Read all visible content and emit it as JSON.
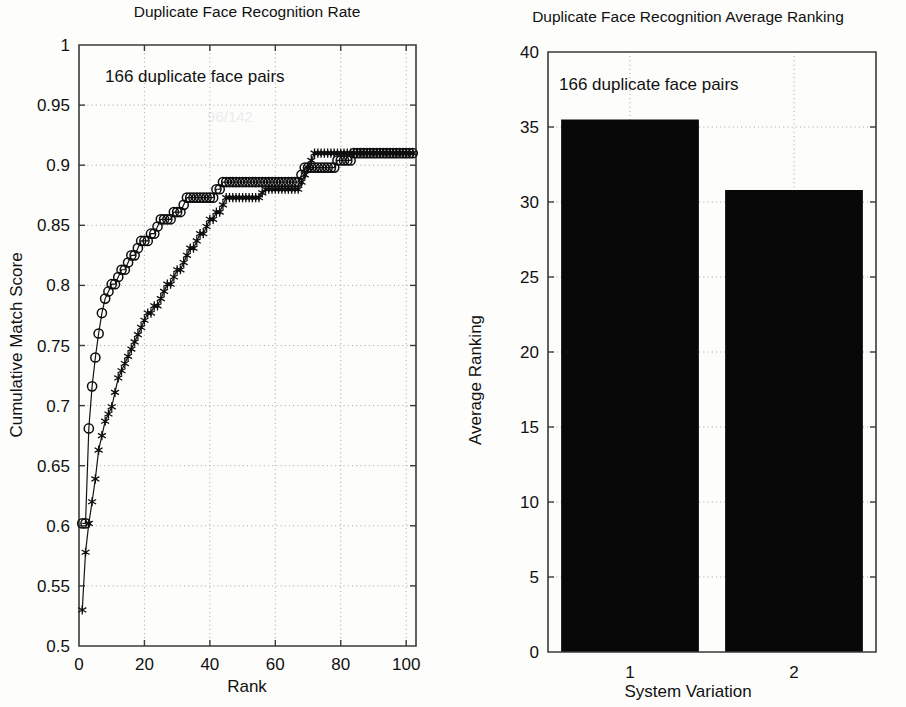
{
  "figure": {
    "background_color": "#fdfdfb",
    "ink_color": "#111111"
  },
  "charts": [
    {
      "id": "cms-curve",
      "title": "Duplicate Face Recognition Rate",
      "annotation": "166 duplicate face pairs",
      "xlabel": "Rank",
      "ylabel": "Cumulative Match Score"
    },
    {
      "id": "avg-ranking-bars",
      "title": "Duplicate Face Recognition Average Ranking",
      "annotation": "166 duplicate face pairs",
      "xlabel": "System Variation",
      "ylabel": "Average Ranking"
    }
  ],
  "chart_data": [
    {
      "type": "line",
      "title": "Duplicate Face Recognition Rate",
      "subtitle": "166 duplicate face pairs",
      "xlabel": "Rank",
      "ylabel": "Cumulative Match Score",
      "xlim": [
        0,
        103
      ],
      "ylim": [
        0.5,
        1.0
      ],
      "xticks": [
        0,
        20,
        40,
        60,
        80,
        100
      ],
      "yticks": [
        0.5,
        0.55,
        0.6,
        0.65,
        0.7,
        0.75,
        0.8,
        0.85,
        0.9,
        0.95,
        1
      ],
      "xticklabels": [
        "0",
        "20",
        "40",
        "60",
        "80",
        "100"
      ],
      "yticklabels": [
        "0.5",
        "0.55",
        "0.6",
        "0.65",
        "0.7",
        "0.75",
        "0.8",
        "0.85",
        "0.9",
        "0.95",
        "1"
      ],
      "grid": true,
      "legend": "none",
      "series": [
        {
          "name": "System Variation 1",
          "marker": "circle",
          "x": [
            1,
            2,
            3,
            4,
            5,
            6,
            7,
            8,
            9,
            10,
            11,
            12,
            13,
            14,
            15,
            16,
            17,
            18,
            19,
            20,
            21,
            22,
            23,
            24,
            25,
            26,
            27,
            28,
            29,
            30,
            31,
            32,
            33,
            34,
            35,
            36,
            37,
            38,
            39,
            40,
            41,
            42,
            43,
            44,
            45,
            46,
            47,
            48,
            49,
            50,
            51,
            52,
            53,
            54,
            55,
            56,
            57,
            58,
            59,
            60,
            61,
            62,
            63,
            64,
            65,
            66,
            67,
            68,
            69,
            70,
            71,
            72,
            73,
            74,
            75,
            76,
            77,
            78,
            79,
            80,
            81,
            82,
            83,
            84,
            85,
            86,
            87,
            88,
            89,
            90,
            91,
            92,
            93,
            94,
            95,
            96,
            97,
            98,
            99,
            100,
            101,
            102
          ],
          "y": [
            0.602,
            0.602,
            0.681,
            0.716,
            0.74,
            0.76,
            0.777,
            0.789,
            0.795,
            0.801,
            0.801,
            0.807,
            0.813,
            0.813,
            0.819,
            0.825,
            0.825,
            0.831,
            0.837,
            0.837,
            0.837,
            0.843,
            0.843,
            0.849,
            0.855,
            0.855,
            0.855,
            0.855,
            0.861,
            0.861,
            0.861,
            0.867,
            0.873,
            0.873,
            0.873,
            0.873,
            0.873,
            0.873,
            0.873,
            0.873,
            0.873,
            0.88,
            0.88,
            0.886,
            0.886,
            0.886,
            0.886,
            0.886,
            0.886,
            0.886,
            0.886,
            0.886,
            0.886,
            0.886,
            0.886,
            0.886,
            0.886,
            0.886,
            0.886,
            0.886,
            0.886,
            0.886,
            0.886,
            0.886,
            0.886,
            0.886,
            0.886,
            0.892,
            0.898,
            0.898,
            0.898,
            0.898,
            0.898,
            0.898,
            0.898,
            0.898,
            0.898,
            0.898,
            0.904,
            0.904,
            0.904,
            0.904,
            0.904,
            0.91,
            0.91,
            0.91,
            0.91,
            0.91,
            0.91,
            0.91,
            0.91,
            0.91,
            0.91,
            0.91,
            0.91,
            0.91,
            0.91,
            0.91,
            0.91,
            0.91,
            0.91,
            0.91
          ]
        },
        {
          "name": "System Variation 2",
          "marker": "star",
          "x": [
            1,
            2,
            3,
            4,
            5,
            6,
            7,
            8,
            9,
            10,
            11,
            12,
            13,
            14,
            15,
            16,
            17,
            18,
            19,
            20,
            21,
            22,
            23,
            24,
            25,
            26,
            27,
            28,
            29,
            30,
            31,
            32,
            33,
            34,
            35,
            36,
            37,
            38,
            39,
            40,
            41,
            42,
            43,
            44,
            45,
            46,
            47,
            48,
            49,
            50,
            51,
            52,
            53,
            54,
            55,
            56,
            57,
            58,
            59,
            60,
            61,
            62,
            63,
            64,
            65,
            66,
            67,
            68,
            69,
            70,
            71,
            72,
            73,
            74,
            75,
            76,
            77,
            78,
            79,
            80,
            81,
            82,
            83,
            84,
            85,
            86,
            87,
            88,
            89,
            90,
            91,
            92,
            93,
            94,
            95,
            96,
            97,
            98,
            99,
            100,
            101,
            102
          ],
          "y": [
            0.53,
            0.578,
            0.602,
            0.62,
            0.639,
            0.663,
            0.675,
            0.687,
            0.693,
            0.699,
            0.711,
            0.723,
            0.729,
            0.735,
            0.741,
            0.747,
            0.753,
            0.759,
            0.765,
            0.771,
            0.777,
            0.777,
            0.783,
            0.783,
            0.789,
            0.795,
            0.801,
            0.801,
            0.807,
            0.813,
            0.813,
            0.819,
            0.825,
            0.831,
            0.831,
            0.837,
            0.843,
            0.843,
            0.849,
            0.855,
            0.855,
            0.861,
            0.861,
            0.867,
            0.873,
            0.873,
            0.873,
            0.873,
            0.873,
            0.873,
            0.873,
            0.873,
            0.873,
            0.873,
            0.873,
            0.877,
            0.88,
            0.88,
            0.88,
            0.88,
            0.88,
            0.88,
            0.88,
            0.88,
            0.88,
            0.88,
            0.88,
            0.886,
            0.892,
            0.898,
            0.904,
            0.91,
            0.91,
            0.91,
            0.91,
            0.91,
            0.91,
            0.91,
            0.91,
            0.91,
            0.91,
            0.91,
            0.91,
            0.91,
            0.91,
            0.91,
            0.91,
            0.91,
            0.91,
            0.91,
            0.91,
            0.91,
            0.91,
            0.91,
            0.91,
            0.91,
            0.91,
            0.91,
            0.91,
            0.91,
            0.91,
            0.91
          ]
        }
      ]
    },
    {
      "type": "bar",
      "title": "Duplicate Face Recognition Average Ranking",
      "subtitle": "166 duplicate face pairs",
      "xlabel": "System Variation",
      "ylabel": "Average Ranking",
      "categories": [
        "1",
        "2"
      ],
      "values": [
        35.5,
        30.8
      ],
      "ylim": [
        0,
        40
      ],
      "xlim": [
        0.5,
        2.5
      ],
      "yticks": [
        0,
        5,
        10,
        15,
        20,
        25,
        30,
        35,
        40
      ],
      "yticklabels": [
        "0",
        "5",
        "10",
        "15",
        "20",
        "25",
        "30",
        "35",
        "40"
      ],
      "xticklabels": [
        "1",
        "2"
      ],
      "grid": true,
      "legend": "none",
      "bar_color": "#080808"
    }
  ]
}
